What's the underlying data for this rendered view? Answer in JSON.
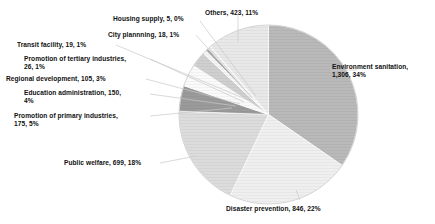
{
  "chart_data": {
    "type": "pie",
    "title": "",
    "subtitle": "",
    "xlabel": "",
    "ylabel": "",
    "legend_position": "none",
    "grid": false,
    "label_format": "name, value, percent",
    "start_angle_deg": 0,
    "direction": "clockwise",
    "total": 3772,
    "categories": [
      "Environment sanitation",
      "Disaster prevention",
      "Public welfare",
      "Promotion of primary industries",
      "Education administration",
      "Regional development",
      "Promotion of tertiary industries",
      "Transit facility",
      "City plannning",
      "Housing supply",
      "Others"
    ],
    "values": [
      1306,
      846,
      699,
      175,
      150,
      105,
      26,
      19,
      18,
      5,
      423
    ],
    "percents": [
      34,
      22,
      18,
      5,
      4,
      3,
      1,
      1,
      1,
      0,
      11
    ],
    "value_labels": [
      "1,306",
      "846",
      "699",
      "175",
      "150",
      "105",
      "26",
      "19",
      "18",
      "5",
      "423"
    ],
    "colors": [
      "#b9b9b9",
      "#efefef",
      "#dcdcdc",
      "#9a9a9a",
      "#fafafa",
      "#cfcfcf",
      "#f4f4f4",
      "#a7a7a7",
      "#e2e2e2",
      "#c4c4c4",
      "#e8e8e8"
    ]
  },
  "labels": {
    "environment_sanitation": "Environment sanitation,\n1,306, 34%",
    "disaster_prevention": "Disaster prevention, 846, 22%",
    "public_welfare": "Public welfare, 699, 18%",
    "promotion_primary": "Promotion of primary industries,\n175, 5%",
    "education_administration": "Education administration, 150,\n4%",
    "regional_development": "Regional development, 105, 3%",
    "promotion_tertiary": "Promotion of tertiary industries,\n26, 1%",
    "transit_facility": "Transit facility, 19, 1%",
    "city_planning": "City plannning, 18, 1%",
    "housing_supply": "Housing supply, 5, 0%",
    "others": "Others, 423, 11%"
  }
}
